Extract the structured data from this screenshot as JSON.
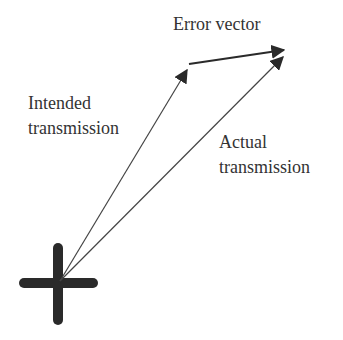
{
  "diagram": {
    "type": "vector-diagram",
    "colors": {
      "ink": "#333333",
      "cross": "#2a2a2a",
      "background": "#ffffff"
    },
    "origin": {
      "shape": "cross",
      "x": 59,
      "y": 283
    },
    "labels": {
      "error_vector": "Error vector",
      "intended_line1": "Intended",
      "intended_line2": "transmission",
      "actual_line1": "Actual",
      "actual_line2": "transmission"
    },
    "vectors": [
      {
        "name": "intended-transmission",
        "from": [
          59,
          283
        ],
        "to": [
          188,
          66
        ]
      },
      {
        "name": "actual-transmission",
        "from": [
          59,
          283
        ],
        "to": [
          285,
          55
        ]
      },
      {
        "name": "error-vector",
        "from": [
          188,
          64
        ],
        "to": [
          285,
          49
        ]
      }
    ]
  }
}
